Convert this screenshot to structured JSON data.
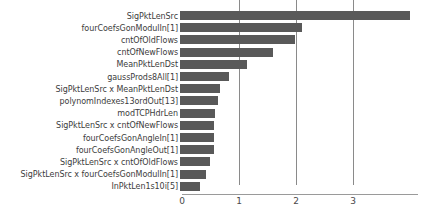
{
  "chart_data": {
    "type": "bar",
    "orientation": "horizontal",
    "title": "",
    "subtitle": "",
    "xlabel": "",
    "ylabel": "",
    "xlim": [
      0,
      4.25
    ],
    "xticks": [
      0,
      1,
      2,
      3
    ],
    "xtick_labels": [
      "0",
      "1",
      "2",
      "3"
    ],
    "grid": true,
    "grid_axis": "x",
    "legend": null,
    "bar_color": "#595959",
    "axis_color": "#8a8a8a",
    "background": "#ffffff",
    "categories": [
      "SigPktLenSrc",
      "fourCoefsGonModulIn[1]",
      "cntOfOldFlows",
      "cntOfNewFlows",
      "MeanPktLenDst",
      "gaussProds8All[1]",
      "SigPktLenSrc x MeanPktLenDst",
      "polynomIndexes13ordOut[13]",
      "modTCPHdrLen",
      "SigPktLenSrc x cntOfNewFlows",
      "fourCoefsGonAngleIn[1]",
      "fourCoefsGonAngleOut[1]",
      "SigPktLenSrc x cntOfOldFlows",
      "SigPktLenSrc x fourCoefsGonModulIn[1]",
      "InPktLen1s10i[5]"
    ],
    "values": [
      4.04,
      2.14,
      2.02,
      1.63,
      1.18,
      0.86,
      0.7,
      0.67,
      0.61,
      0.6,
      0.6,
      0.6,
      0.53,
      0.46,
      0.35
    ]
  }
}
